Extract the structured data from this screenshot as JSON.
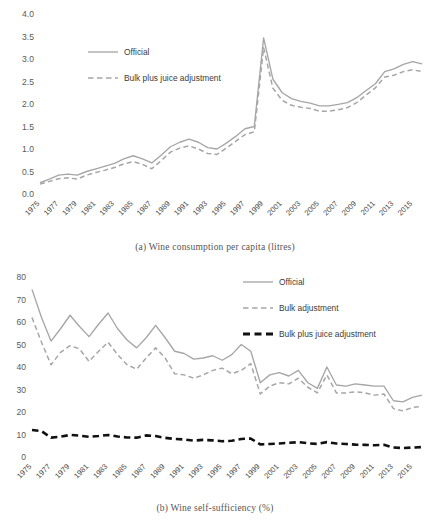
{
  "figure": {
    "panels": [
      {
        "id": "a",
        "caption": "(a)  Wine consumption per capita (litres)",
        "caption_index": "(a)",
        "caption_text": "Wine consumption per capita (litres)"
      },
      {
        "id": "b",
        "caption": "(b)  Wine self-sufficiency (%)",
        "caption_index": "(b)",
        "caption_text": "Wine self-sufficiency (%)"
      }
    ]
  },
  "colors": {
    "official": "#a6a6a6",
    "bulk_adjustment": "#a6a6a6",
    "bulk_plus_juice": "#a6a6a6",
    "bulk_plus_juice_black": "#111111",
    "axis_text": "#555555",
    "background": "#ffffff"
  },
  "chart_data": [
    {
      "type": "line",
      "id": "wine-consumption-per-capita",
      "title": "(a)  Wine consumption per capita (litres)",
      "xlabel": "",
      "ylabel": "",
      "ylim": [
        0.0,
        4.0
      ],
      "yticks": [
        "0.0",
        "0.5",
        "1.0",
        "1.5",
        "2.0",
        "2.5",
        "3.0",
        "3.5",
        "4.0"
      ],
      "ytick_values": [
        0.0,
        0.5,
        1.0,
        1.5,
        2.0,
        2.5,
        3.0,
        3.5,
        4.0
      ],
      "grid": false,
      "legend_position": "upper-left",
      "x": [
        1975,
        1976,
        1977,
        1978,
        1979,
        1980,
        1981,
        1982,
        1983,
        1984,
        1985,
        1986,
        1987,
        1988,
        1989,
        1990,
        1991,
        1992,
        1993,
        1994,
        1995,
        1996,
        1997,
        1998,
        1999,
        2000,
        2001,
        2002,
        2003,
        2004,
        2005,
        2006,
        2007,
        2008,
        2009,
        2010,
        2011,
        2012,
        2013,
        2014,
        2015,
        2016
      ],
      "xtick_labels": [
        "1975",
        "1977",
        "1979",
        "1981",
        "1983",
        "1985",
        "1987",
        "1989",
        "1991",
        "1993",
        "1995",
        "1997",
        "1999",
        "2001",
        "2003",
        "2005",
        "2007",
        "2009",
        "2011",
        "2013",
        "2015"
      ],
      "series": [
        {
          "name": "Official",
          "style": "solid",
          "color": "#a6a6a6",
          "values": [
            0.25,
            0.33,
            0.42,
            0.44,
            0.42,
            0.5,
            0.56,
            0.62,
            0.68,
            0.78,
            0.85,
            0.78,
            0.69,
            0.86,
            1.05,
            1.15,
            1.22,
            1.15,
            1.03,
            1.0,
            1.13,
            1.28,
            1.45,
            1.5,
            3.47,
            2.55,
            2.25,
            2.12,
            2.06,
            2.02,
            1.96,
            1.96,
            1.99,
            2.03,
            2.14,
            2.3,
            2.45,
            2.72,
            2.78,
            2.88,
            2.94,
            2.89
          ]
        },
        {
          "name": "Bulk plus juice adjustment",
          "style": "dashed",
          "color": "#a6a6a6",
          "values": [
            0.22,
            0.28,
            0.34,
            0.36,
            0.33,
            0.42,
            0.48,
            0.53,
            0.59,
            0.67,
            0.72,
            0.66,
            0.56,
            0.74,
            0.93,
            1.02,
            1.07,
            1.0,
            0.9,
            0.88,
            1.02,
            1.17,
            1.32,
            1.38,
            3.25,
            2.35,
            2.08,
            1.97,
            1.93,
            1.9,
            1.84,
            1.84,
            1.87,
            1.92,
            2.03,
            2.2,
            2.36,
            2.6,
            2.64,
            2.72,
            2.76,
            2.72
          ]
        }
      ]
    },
    {
      "type": "line",
      "id": "wine-self-sufficiency",
      "title": "(b)  Wine self-sufficiency (%)",
      "xlabel": "",
      "ylabel": "",
      "ylim": [
        0,
        80
      ],
      "yticks": [
        "0",
        "10",
        "20",
        "30",
        "40",
        "50",
        "60",
        "70",
        "80"
      ],
      "ytick_values": [
        0,
        10,
        20,
        30,
        40,
        50,
        60,
        70,
        80
      ],
      "grid": false,
      "legend_position": "upper-right",
      "x": [
        1975,
        1976,
        1977,
        1978,
        1979,
        1980,
        1981,
        1982,
        1983,
        1984,
        1985,
        1986,
        1987,
        1988,
        1989,
        1990,
        1991,
        1992,
        1993,
        1994,
        1995,
        1996,
        1997,
        1998,
        1999,
        2000,
        2001,
        2002,
        2003,
        2004,
        2005,
        2006,
        2007,
        2008,
        2009,
        2010,
        2011,
        2012,
        2013,
        2014,
        2015,
        2016
      ],
      "xtick_labels": [
        "1975",
        "1977",
        "1979",
        "1981",
        "1983",
        "1985",
        "1987",
        "1989",
        "1991",
        "1993",
        "1995",
        "1997",
        "1999",
        "2001",
        "2003",
        "2005",
        "2007",
        "2009",
        "2011",
        "2013",
        "2015"
      ],
      "series": [
        {
          "name": "Official",
          "style": "solid",
          "color": "#a6a6a6",
          "values": [
            74.5,
            62.0,
            51.5,
            57.0,
            63.0,
            58.0,
            53.5,
            59.0,
            64.0,
            57.0,
            52.0,
            48.5,
            53.0,
            58.5,
            53.0,
            47.0,
            46.0,
            43.5,
            44.0,
            45.0,
            43.0,
            45.5,
            50.0,
            47.0,
            33.0,
            36.5,
            37.5,
            36.0,
            38.5,
            33.0,
            30.5,
            40.0,
            32.0,
            31.5,
            32.5,
            32.0,
            31.5,
            31.5,
            25.0,
            24.5,
            26.5,
            27.5
          ]
        },
        {
          "name": "Bulk adjustment",
          "style": "dashed",
          "color": "#a6a6a6",
          "values": [
            62.0,
            51.0,
            41.0,
            46.5,
            49.5,
            48.0,
            42.5,
            47.0,
            51.0,
            45.5,
            41.0,
            39.0,
            44.0,
            48.5,
            44.0,
            37.0,
            36.5,
            35.0,
            36.5,
            38.5,
            39.5,
            37.0,
            38.5,
            41.5,
            28.0,
            31.5,
            33.0,
            32.5,
            35.0,
            31.0,
            28.5,
            36.5,
            28.5,
            28.5,
            29.0,
            28.5,
            27.5,
            28.0,
            21.5,
            20.5,
            22.0,
            22.5
          ]
        },
        {
          "name": "Bulk plus juice adjustment",
          "style": "dashed-bold",
          "color": "#111111",
          "values": [
            12.0,
            11.5,
            8.6,
            9.0,
            9.8,
            9.5,
            9.0,
            9.3,
            9.8,
            9.1,
            8.7,
            8.6,
            9.6,
            9.3,
            8.5,
            8.0,
            7.8,
            7.3,
            7.6,
            7.4,
            7.0,
            7.2,
            8.0,
            8.2,
            5.6,
            5.8,
            6.0,
            6.3,
            6.6,
            6.1,
            5.8,
            6.6,
            6.0,
            5.8,
            5.5,
            5.4,
            5.2,
            5.4,
            4.2,
            4.0,
            4.2,
            4.4
          ]
        }
      ]
    }
  ]
}
